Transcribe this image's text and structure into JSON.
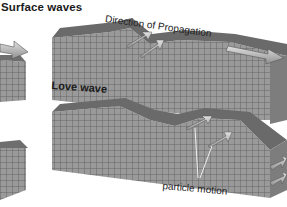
{
  "diagram": {
    "title": "Surface waves",
    "labels": {
      "direction": "Direction of Propagation",
      "love_wave": "Love wave",
      "particle_motion": "particle motion"
    },
    "colors": {
      "block_face": "#8f8f8f",
      "block_top": "#6a6a6a",
      "grid_line": "#555555",
      "arrow": "#b5b5b5",
      "text": "#1a1a1a"
    }
  }
}
